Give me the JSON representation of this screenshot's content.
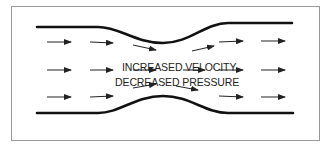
{
  "diagram": {
    "type": "venturi-flow",
    "labels": {
      "velocity": "INCREASED VELOCITY",
      "pressure": "DECREASED PRESSURE"
    },
    "colors": {
      "wall": "#111111",
      "arrow": "#222222",
      "border": "#9a9a9a",
      "text": "#222222"
    },
    "arrows": {
      "rows": 3,
      "count_per_row": 6
    }
  }
}
